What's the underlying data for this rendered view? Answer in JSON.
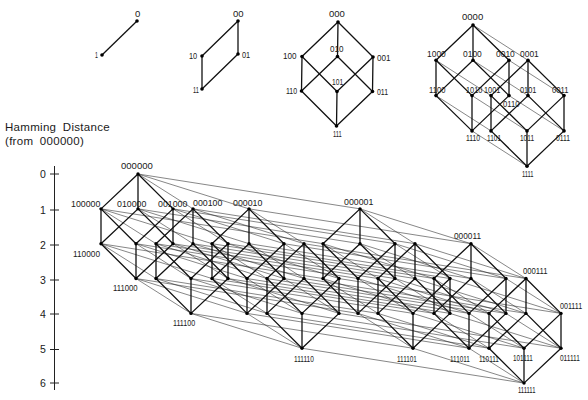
{
  "diagram": {
    "axis": {
      "title": "Hamming Distance",
      "subtitle": "(from 000000)",
      "x": 54.5,
      "y_top": 166,
      "y_bottom": 390,
      "label_x": 43,
      "ticks": [
        {
          "label": "0",
          "y": 174
        },
        {
          "label": "1",
          "y": 210
        },
        {
          "label": "2",
          "y": 245
        },
        {
          "label": "3",
          "y": 280
        },
        {
          "label": "4",
          "y": 314
        },
        {
          "label": "5",
          "y": 349.5
        },
        {
          "label": "6",
          "y": 383
        }
      ]
    },
    "cubes": [
      {
        "dim": 1,
        "origin": [
          137,
          21
        ],
        "vectors": [
          [
            -35,
            34
          ]
        ],
        "thick_bits": [
          0
        ],
        "dot_r": 1.8,
        "labels": [
          {
            "text": "0",
            "x": 135,
            "y": 17
          },
          {
            "text": "1",
            "x": 95,
            "y": 58
          }
        ]
      },
      {
        "dim": 2,
        "origin": [
          238,
          21
        ],
        "vectors": [
          [
            -36,
            35
          ],
          [
            0,
            33
          ]
        ],
        "thick_bits": [
          0,
          1
        ],
        "dot_r": 1.8,
        "labels": [
          {
            "text": "00",
            "x": 233,
            "y": 17
          },
          {
            "text": "10",
            "x": 189,
            "y": 59
          },
          {
            "text": "01",
            "x": 242,
            "y": 57.5
          },
          {
            "text": "11",
            "x": 193,
            "y": 93
          }
        ]
      },
      {
        "dim": 3,
        "origin": [
          338,
          22
        ],
        "vectors": [
          [
            -36,
            34.5
          ],
          [
            -0.5,
            34.5
          ],
          [
            35,
            35
          ]
        ],
        "thick_bits": [
          0,
          1,
          2
        ],
        "dot_r": 1.8,
        "labels": [
          {
            "text": "000",
            "x": 329,
            "y": 17
          },
          {
            "text": "100",
            "x": 283,
            "y": 58.5
          },
          {
            "text": "010",
            "x": 330,
            "y": 52
          },
          {
            "text": "001",
            "x": 377,
            "y": 61
          },
          {
            "text": "110",
            "x": 286,
            "y": 94
          },
          {
            "text": "101",
            "x": 332,
            "y": 85
          },
          {
            "text": "011",
            "x": 377,
            "y": 95
          },
          {
            "text": "111",
            "x": 333,
            "y": 137
          }
        ]
      },
      {
        "dim": 4,
        "origin": [
          473,
          25
        ],
        "vectors": [
          [
            -37,
            35.3
          ],
          [
            0,
            35.3
          ],
          [
            36,
            35.3
          ],
          [
            55,
            35.3
          ]
        ],
        "thick_bits": [
          0,
          1,
          2
        ],
        "dot_r": 1.8,
        "labels": [
          {
            "text": "0000",
            "x": 462,
            "y": 19.5
          },
          {
            "text": "1000",
            "x": 427,
            "y": 56.5
          },
          {
            "text": "0100",
            "x": 463,
            "y": 56.5
          },
          {
            "text": "0010",
            "x": 496,
            "y": 56.5
          },
          {
            "text": "0001",
            "x": 520,
            "y": 56.5
          },
          {
            "text": "1100",
            "x": 429,
            "y": 93
          },
          {
            "text": "1010",
            "x": 466,
            "y": 93
          },
          {
            "text": "1001",
            "x": 484,
            "y": 93
          },
          {
            "text": "0110",
            "x": 503,
            "y": 106.5
          },
          {
            "text": "0101",
            "x": 520,
            "y": 93
          },
          {
            "text": "0011",
            "x": 552,
            "y": 93
          },
          {
            "text": "1110",
            "x": 466,
            "y": 141
          },
          {
            "text": "1101",
            "x": 487,
            "y": 141
          },
          {
            "text": "1011",
            "x": 520,
            "y": 141
          },
          {
            "text": "0111",
            "x": 556,
            "y": 141
          },
          {
            "text": "1111",
            "x": 522,
            "y": 176.5
          }
        ]
      },
      {
        "dim": 6,
        "origin": [
          138,
          174
        ],
        "vectors": [
          [
            -37,
            34.85
          ],
          [
            0,
            34.85
          ],
          [
            35,
            34.85
          ],
          [
            55,
            34.85
          ],
          [
            111,
            34.85
          ],
          [
            222,
            34.85
          ]
        ],
        "thick_bits": [
          0,
          1,
          2
        ],
        "dot_r": 1.7,
        "labels": [
          {
            "text": "000000",
            "x": 121,
            "y": 169
          },
          {
            "text": "100000",
            "x": 71,
            "y": 206.5
          },
          {
            "text": "010000",
            "x": 117,
            "y": 206.5
          },
          {
            "text": "001000",
            "x": 158,
            "y": 206.5
          },
          {
            "text": "000100",
            "x": 193,
            "y": 205.5
          },
          {
            "text": "000010",
            "x": 233,
            "y": 205.5
          },
          {
            "text": "000001",
            "x": 344,
            "y": 204.5
          },
          {
            "text": "110000",
            "x": 73,
            "y": 257
          },
          {
            "text": "000011",
            "x": 454,
            "y": 238.5
          },
          {
            "text": "111000",
            "x": 113,
            "y": 291
          },
          {
            "text": "000111",
            "x": 523,
            "y": 274
          },
          {
            "text": "111100",
            "x": 173,
            "y": 326
          },
          {
            "text": "001111",
            "x": 560,
            "y": 309
          },
          {
            "text": "111110",
            "x": 294,
            "y": 362
          },
          {
            "text": "111101",
            "x": 397,
            "y": 361.5
          },
          {
            "text": "111011",
            "x": 450,
            "y": 362
          },
          {
            "text": "110111",
            "x": 479,
            "y": 362
          },
          {
            "text": "101111",
            "x": 513,
            "y": 361
          },
          {
            "text": "011111",
            "x": 560,
            "y": 361
          },
          {
            "text": "111111",
            "x": 518,
            "y": 393
          }
        ]
      }
    ]
  }
}
